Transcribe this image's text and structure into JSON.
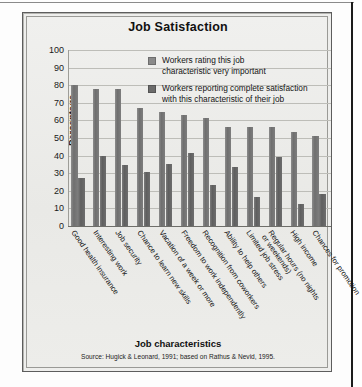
{
  "figure": {
    "title": "Job Satisfaction",
    "xtitle": "Job characteristics",
    "ytitle": "Percentage",
    "source": "Source: Hugick & Leonard, 1991; based on Rathus & Nevid, 1995."
  },
  "legend": {
    "items": [
      {
        "label_line1": "Workers rating this job",
        "label_line2": "characteristic very important",
        "color": "#8a8a8a"
      },
      {
        "label_line1": "Workers reporting complete satisfaction",
        "label_line2": "with this characteristic of their job",
        "color": "#6b6b6b"
      }
    ]
  },
  "chart_data": {
    "type": "bar",
    "title": "Job Satisfaction",
    "xlabel": "Job characteristics",
    "ylabel": "Percentage",
    "ylim": [
      0,
      100
    ],
    "yticks": [
      0,
      10,
      20,
      30,
      40,
      50,
      60,
      70,
      80,
      90,
      100
    ],
    "grid": true,
    "legend_position": "upper-right-inside",
    "categories": [
      "Good health insurance",
      "Interesting work",
      "Job security",
      "Chance to learn new skills",
      "Vacation of a week or more",
      "Freedom to work independently",
      "Recognition from coworkers",
      "Ability to help others",
      "Limited job stress",
      "Regular hours (no nights\nor weekends)",
      "High income",
      "Chances for promotion"
    ],
    "series": [
      {
        "name": "Workers rating this job characteristic very important",
        "color": "#8a8a8a",
        "values": [
          80,
          78,
          78,
          67,
          65,
          63,
          61.5,
          56,
          56,
          56,
          53.5,
          51
        ]
      },
      {
        "name": "Workers reporting complete satisfaction with this characteristic of their job",
        "color": "#6b6b6b",
        "values": [
          27,
          40,
          34.5,
          30.5,
          35,
          41.5,
          23.5,
          33.5,
          16.5,
          39,
          12.5,
          18
        ]
      }
    ],
    "source_note": "Source: Hugick & Leonard, 1991; based on Rathus & Nevid, 1995."
  }
}
